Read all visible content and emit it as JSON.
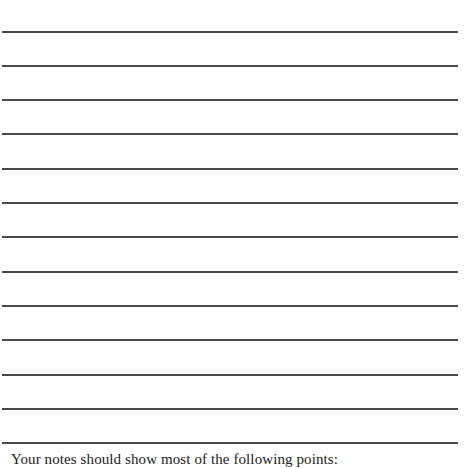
{
  "document": {
    "type": "ruled-writing-page",
    "ruled_lines": {
      "count": 13,
      "positions_y": [
        31,
        65,
        99,
        133,
        168,
        202,
        236,
        271,
        305,
        339,
        374,
        408,
        442
      ],
      "color": "#4a4a4a"
    },
    "caption": {
      "text": "Your notes should show most of the following points:"
    }
  }
}
